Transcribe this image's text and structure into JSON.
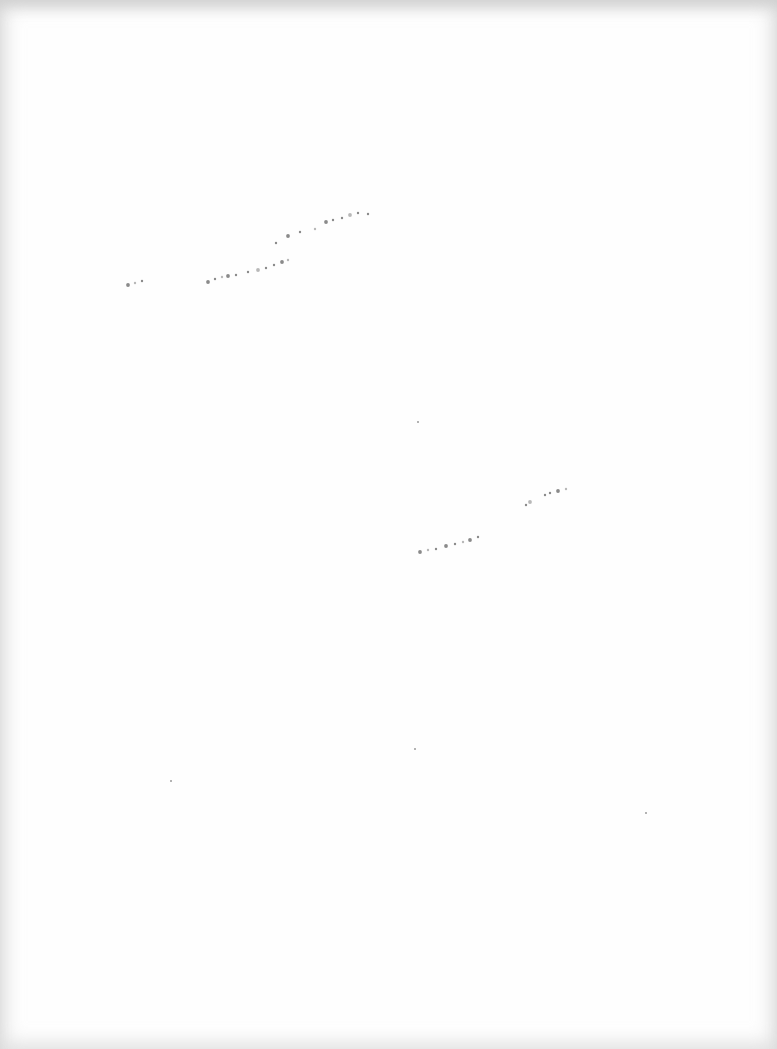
{
  "page": {
    "type": "blank scanned page",
    "background": "#fefefe",
    "border_tint": "#d2d2d2"
  },
  "marks": {
    "trace_1": {
      "description": "faint dotted curve (upper left)",
      "color": "#8a8a8a",
      "points": [
        [
          128,
          285
        ],
        [
          135,
          283
        ],
        [
          142,
          281
        ],
        [
          208,
          282
        ],
        [
          215,
          279
        ],
        [
          222,
          277
        ],
        [
          228,
          276
        ],
        [
          236,
          275
        ],
        [
          248,
          272
        ],
        [
          258,
          270
        ],
        [
          266,
          268
        ],
        [
          274,
          265
        ],
        [
          282,
          262
        ],
        [
          288,
          260
        ],
        [
          276,
          243
        ],
        [
          288,
          236
        ],
        [
          300,
          232
        ],
        [
          315,
          229
        ],
        [
          326,
          222
        ],
        [
          333,
          220
        ],
        [
          342,
          218
        ],
        [
          350,
          215
        ],
        [
          358,
          213
        ],
        [
          368,
          214
        ]
      ]
    },
    "trace_2": {
      "description": "faint dotted curve (middle right)",
      "color": "#8a8a8a",
      "points": [
        [
          420,
          552
        ],
        [
          428,
          550
        ],
        [
          436,
          549
        ],
        [
          446,
          546
        ],
        [
          455,
          544
        ],
        [
          463,
          542
        ],
        [
          470,
          540
        ],
        [
          478,
          537
        ],
        [
          526,
          505
        ],
        [
          530,
          502
        ],
        [
          545,
          495
        ],
        [
          550,
          493
        ],
        [
          558,
          491
        ],
        [
          566,
          489
        ]
      ]
    },
    "specks": [
      [
        417,
        421
      ],
      [
        414,
        748
      ],
      [
        645,
        812
      ],
      [
        170,
        780
      ]
    ]
  }
}
